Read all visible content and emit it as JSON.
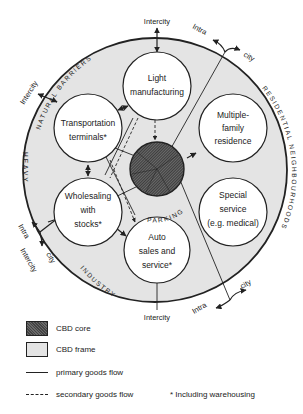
{
  "diagram": {
    "colors": {
      "frame_fill": "#e4e4e4",
      "core_fill": "#555555",
      "stroke": "#222222",
      "circle_fill": "#ffffff"
    },
    "zones": [
      {
        "label": "NATURAL BARRIERS"
      },
      {
        "label": "RESIDENTIAL NEIGHBOURHOODS"
      },
      {
        "label": "HEAVY"
      },
      {
        "label": "INDUSTRY"
      },
      {
        "label": "PARKING"
      }
    ],
    "nodes": [
      {
        "id": "light",
        "lines": [
          "Light",
          "manufacturing"
        ]
      },
      {
        "id": "transport",
        "lines": [
          "Transportation",
          "terminals*"
        ]
      },
      {
        "id": "residence",
        "lines": [
          "Multiple-",
          "family",
          "residence"
        ]
      },
      {
        "id": "wholesale",
        "lines": [
          "Wholesaling",
          "with",
          "stocks*"
        ]
      },
      {
        "id": "special",
        "lines": [
          "Special",
          "service",
          "(e.g. medical)"
        ]
      },
      {
        "id": "auto",
        "lines": [
          "Auto",
          "sales and",
          "service*"
        ]
      }
    ],
    "flow_labels": {
      "top_intercity": "Intercity",
      "topleft_intercity": "Intercity",
      "topright_intra": "Intra",
      "topright_city": "city",
      "left_intra": "Intra",
      "left_intercity": "Intercity",
      "left_city": "city",
      "bottom_intercity": "Intercity",
      "bottomright_intra": "Intra",
      "bottomright_city": "city"
    }
  },
  "legend": {
    "core": "CBD core",
    "frame": "CBD frame",
    "primary": "primary goods flow",
    "secondary": "secondary goods flow",
    "footnote": "* Including warehousing"
  }
}
